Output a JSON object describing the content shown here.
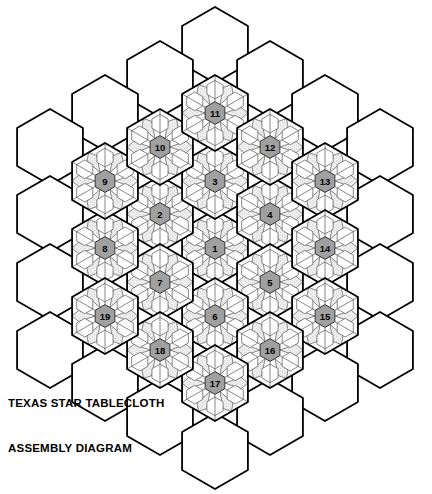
{
  "document": {
    "kind": "quilt-assembly-diagram",
    "title_line1": "TEXAS STAR TABLECLOTH",
    "title_line2": "ASSEMBLY DIAGRAM",
    "width": 432,
    "height": 494
  },
  "colors": {
    "outline": "#000000",
    "inner_line": "#555555",
    "background": "#ffffff",
    "stipple_fill": "#e9e9e9",
    "plain_fill": "#ffffff",
    "number_hex_fill": "#a0a0a0",
    "number_text": "#000000"
  },
  "geometry": {
    "hex_radius": 38,
    "col_step": 55,
    "row_step": 67.5,
    "center_x": 215,
    "center_y": 248,
    "orientation": "pointy-top"
  },
  "blocks": {
    "note": "19 patterned star blocks; each has a center hexagon labeled with its assembly number, six rhombi and six edge hexagons",
    "items": [
      {
        "label": "1",
        "cx": 215,
        "cy": 248
      },
      {
        "label": "2",
        "cx": 160,
        "cy": 214
      },
      {
        "label": "3",
        "cx": 215,
        "cy": 181
      },
      {
        "label": "4",
        "cx": 270,
        "cy": 214
      },
      {
        "label": "5",
        "cx": 270,
        "cy": 282
      },
      {
        "label": "6",
        "cx": 215,
        "cy": 316
      },
      {
        "label": "7",
        "cx": 160,
        "cy": 282
      },
      {
        "label": "8",
        "cx": 105,
        "cy": 248
      },
      {
        "label": "9",
        "cx": 105,
        "cy": 181
      },
      {
        "label": "10",
        "cx": 160,
        "cy": 147
      },
      {
        "label": "11",
        "cx": 215,
        "cy": 113
      },
      {
        "label": "12",
        "cx": 270,
        "cy": 147
      },
      {
        "label": "13",
        "cx": 325,
        "cy": 181
      },
      {
        "label": "14",
        "cx": 325,
        "cy": 248
      },
      {
        "label": "15",
        "cx": 325,
        "cy": 316
      },
      {
        "label": "16",
        "cx": 270,
        "cy": 350
      },
      {
        "label": "17",
        "cx": 215,
        "cy": 383
      },
      {
        "label": "18",
        "cx": 160,
        "cy": 350
      },
      {
        "label": "19",
        "cx": 105,
        "cy": 316
      }
    ]
  },
  "plain_hexes": {
    "note": "undecorated background hexagons forming the outer border of the tablecloth",
    "items": [
      {
        "cx": 215,
        "cy": 45
      },
      {
        "cx": 160,
        "cy": 79
      },
      {
        "cx": 270,
        "cy": 79
      },
      {
        "cx": 105,
        "cy": 113
      },
      {
        "cx": 325,
        "cy": 113
      },
      {
        "cx": 50,
        "cy": 147
      },
      {
        "cx": 380,
        "cy": 147
      },
      {
        "cx": 50,
        "cy": 214
      },
      {
        "cx": 380,
        "cy": 214
      },
      {
        "cx": 50,
        "cy": 282
      },
      {
        "cx": 380,
        "cy": 282
      },
      {
        "cx": 50,
        "cy": 350
      },
      {
        "cx": 380,
        "cy": 350
      },
      {
        "cx": 105,
        "cy": 383
      },
      {
        "cx": 325,
        "cy": 383
      },
      {
        "cx": 160,
        "cy": 417
      },
      {
        "cx": 270,
        "cy": 417
      },
      {
        "cx": 215,
        "cy": 451
      }
    ]
  }
}
